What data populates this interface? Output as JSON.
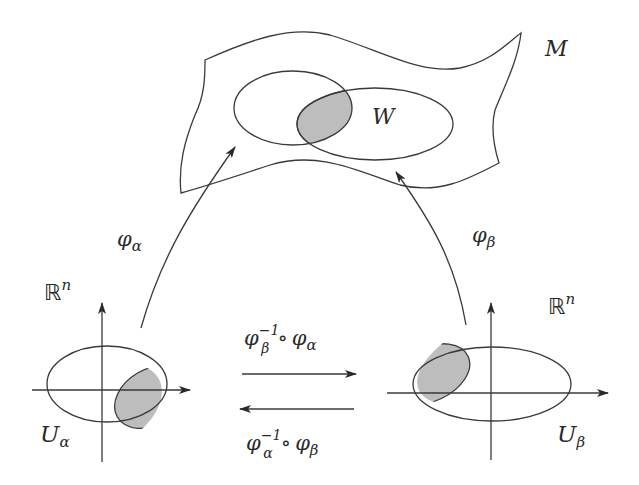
{
  "diagram": {
    "manifold": {
      "label": "M",
      "overlap_label": "W",
      "shade_color": "#bdbdbd",
      "line_color": "#3a3a3a"
    },
    "left_chart": {
      "space_label": "ℝ",
      "space_sup": "n",
      "domain_label": "U",
      "domain_sub": "α",
      "map_label": "φ",
      "map_sub": "α"
    },
    "right_chart": {
      "space_label": "ℝ",
      "space_sup": "n",
      "domain_label": "U",
      "domain_sub": "β",
      "map_label": "φ",
      "map_sub": "β"
    },
    "transition_forward": {
      "phi1": "φ",
      "sub1": "β",
      "sup1": "−1",
      "compose": "∘",
      "phi2": "φ",
      "sub2": "α"
    },
    "transition_backward": {
      "phi1": "φ",
      "sub1": "α",
      "sup1": "−1",
      "compose": "∘",
      "phi2": "φ",
      "sub2": "β"
    }
  }
}
